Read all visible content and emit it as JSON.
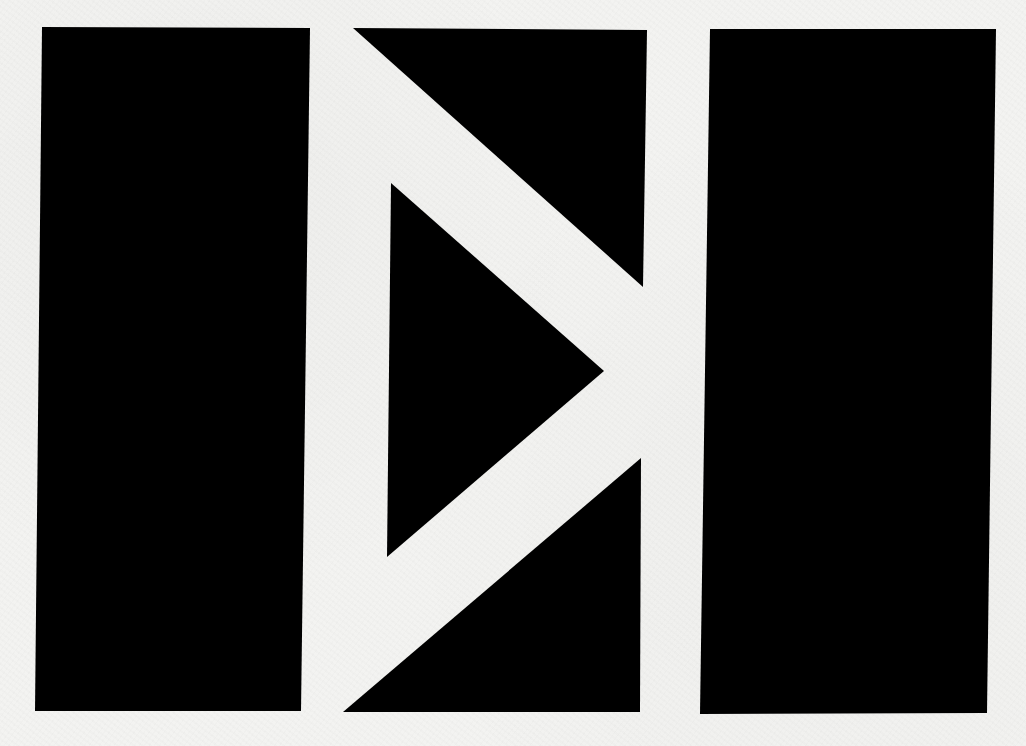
{
  "artwork": {
    "description": "Abstract geometric black-on-white composition: two vertical bars flanking a play-arrow triangle split by white diagonal bands",
    "colors": {
      "background": "#f3f3f1",
      "shape_fill": "#000000"
    },
    "shapes": [
      {
        "name": "left-bar",
        "type": "polygon",
        "points": "42,27 310,28 301,711 35,711"
      },
      {
        "name": "top-triangle",
        "type": "polygon",
        "points": "353,28 647,30 643,287"
      },
      {
        "name": "play-triangle",
        "type": "polygon",
        "points": "391,183 604,371 387,557"
      },
      {
        "name": "bottom-triangle",
        "type": "polygon",
        "points": "343,712 640,712 641,458"
      },
      {
        "name": "right-bar",
        "type": "polygon",
        "points": "710,29 996,29 987,713 700,714"
      }
    ]
  }
}
